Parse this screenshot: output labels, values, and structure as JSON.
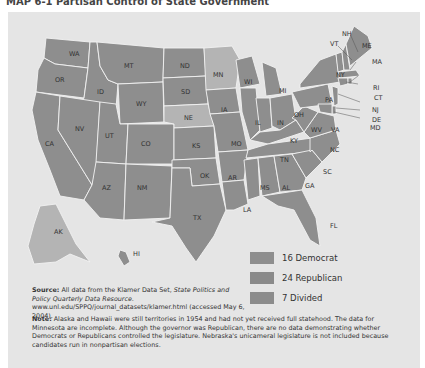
{
  "title": "MAP 6-1 Partisan Control of State Government",
  "colors": {
    "democrat": "#8e8e8e",
    "republican": "#8a8a8a",
    "divided": "#b4b4b4",
    "background": "#e5e5e5"
  },
  "legend": [
    {
      "label": "16 Democrat"
    },
    {
      "label": "24 Republican"
    },
    {
      "label": "7 Divided"
    }
  ],
  "source": {
    "label": "Source:",
    "text1": "All data from the Klamer Data Set, ",
    "italic": "State Politics and Policy Quarterly Data Resource.",
    "text2": " www.unl.edu/SPPQ/journal_datasets/klamer.html (accessed May 6, 2004)."
  },
  "note": {
    "label": "Note:",
    "text": "Alaska and Hawaii were still territories in 1954 and had not yet received full statehood. The data for Minnesota are incomplete. Although the governor was Republican, there are no data demonstrating whether Democrats or Republicans controlled the legislature. Nebraska's unicameral legislature is not included because candidates run in nonpartisan elections."
  },
  "states": {
    "WA": "WA",
    "OR": "OR",
    "CA": "CA",
    "ID": "ID",
    "NV": "NV",
    "MT": "MT",
    "WY": "WY",
    "UT": "UT",
    "AZ": "AZ",
    "CO": "CO",
    "NM": "NM",
    "ND": "ND",
    "SD": "SD",
    "NE": "NE",
    "KS": "KS",
    "OK": "OK",
    "TX": "TX",
    "MN": "MN",
    "IA": "IA",
    "MO": "MO",
    "AR": "AR",
    "LA": "LA",
    "WI": "WI",
    "IL": "IL",
    "MI": "MI",
    "IN": "IN",
    "OH": "OH",
    "KY": "KY",
    "TN": "TN",
    "MS": "MS",
    "AL": "AL",
    "GA": "GA",
    "FL": "FL",
    "SC": "SC",
    "NC": "NC",
    "VA": "VA",
    "WV": "WV",
    "PA": "PA",
    "NY": "NY",
    "VT": "VT",
    "NH": "NH",
    "ME": "ME",
    "MA": "MA",
    "RI": "RI",
    "CT": "CT",
    "NJ": "NJ",
    "DE": "DE",
    "MD": "MD",
    "AK": "AK",
    "HI": "HI"
  }
}
